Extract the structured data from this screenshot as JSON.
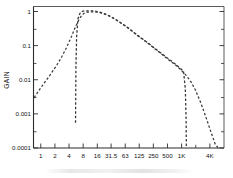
{
  "figure": {
    "name": "gain-frequency-response-plot",
    "background_color": "#ffffff",
    "line_color": "#333333"
  },
  "chart_data": {
    "type": "line",
    "title": "",
    "subtitle": "",
    "xlabel": "",
    "ylabel": "GAIN",
    "xscale": "log",
    "yscale": "log",
    "xlim": [
      0.7,
      8000
    ],
    "ylim": [
      0.0001,
      1.4
    ],
    "grid": false,
    "legend": null,
    "x_tick_labels": [
      "1",
      "2",
      "4",
      "8",
      "16",
      "31.5",
      "63",
      "125",
      "250",
      "500",
      "1K",
      "4K"
    ],
    "x_tick_values": [
      1,
      2,
      4,
      8,
      16,
      31.5,
      63,
      125,
      250,
      500,
      1000,
      4000
    ],
    "x_minor_tick_values": [
      2000
    ],
    "y_tick_labels": [
      "1",
      "0.1",
      "0.01",
      "0.001",
      "0.0001"
    ],
    "y_tick_values": [
      1,
      0.1,
      0.01,
      0.001,
      0.0001
    ],
    "series": [
      {
        "name": "band-limited response",
        "style": "dashed",
        "x": [
          5.5,
          5.6,
          5.8,
          6.2,
          7.0,
          8.0,
          9.5,
          11.0,
          13.0,
          16.0,
          20.0,
          25.0,
          31.5,
          40.0,
          50.0,
          63.0,
          80.0,
          100.0,
          125.0,
          160.0,
          200.0,
          250.0,
          315.0,
          400.0,
          500.0,
          630.0,
          800.0,
          1000.0,
          1100.0,
          1200.0,
          1250.0,
          1260.0
        ],
        "y": [
          0.00055,
          0.02,
          0.18,
          0.62,
          0.95,
          1.03,
          1.05,
          1.05,
          1.04,
          1.0,
          0.92,
          0.82,
          0.7,
          0.58,
          0.47,
          0.38,
          0.3,
          0.235,
          0.185,
          0.145,
          0.115,
          0.09,
          0.07,
          0.055,
          0.043,
          0.034,
          0.026,
          0.02,
          0.0175,
          0.0055,
          0.0006,
          0.0001
        ]
      },
      {
        "name": "broadband response",
        "style": "dashed",
        "x": [
          0.72,
          0.85,
          1.0,
          1.3,
          1.7,
          2.2,
          2.8,
          3.5,
          4.4,
          5.5,
          6.5,
          7.5,
          8.5,
          10.0,
          12.0,
          14.0,
          16.0,
          20.0,
          25.0,
          31.5,
          40.0,
          50.0,
          63.0,
          80.0,
          100.0,
          125.0,
          160.0,
          200.0,
          250.0,
          315.0,
          400.0,
          500.0,
          630.0,
          800.0,
          1000.0,
          1250.0,
          1600.0,
          2000.0,
          2600.0,
          3300.0,
          4200.0,
          5200.0,
          6000.0
        ],
        "y": [
          0.003,
          0.0042,
          0.0058,
          0.0095,
          0.016,
          0.027,
          0.047,
          0.085,
          0.17,
          0.36,
          0.58,
          0.78,
          0.9,
          0.96,
          0.97,
          0.965,
          0.95,
          0.9,
          0.8,
          0.69,
          0.57,
          0.465,
          0.375,
          0.295,
          0.23,
          0.18,
          0.142,
          0.112,
          0.088,
          0.068,
          0.053,
          0.041,
          0.032,
          0.025,
          0.0185,
          0.0135,
          0.0085,
          0.0048,
          0.002,
          0.0008,
          0.0003,
          0.00013,
          0.0001
        ]
      }
    ]
  }
}
